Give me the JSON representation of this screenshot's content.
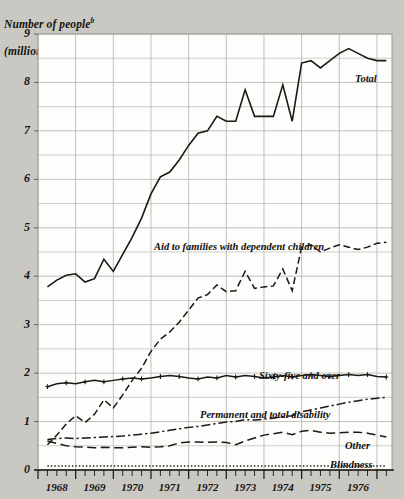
{
  "chart_data": {
    "type": "line",
    "title_superscript": "b",
    "xlabel": "",
    "ylabel": "Number of people (millions)",
    "ylim": [
      0,
      9
    ],
    "xlim": [
      1967.5,
      1976.9
    ],
    "y_major_ticks": [
      0,
      1,
      2,
      3,
      4,
      5,
      6,
      7,
      8,
      9
    ],
    "y_minor_step": 0.5,
    "x_tick_labels": [
      "1968",
      "1969",
      "1970",
      "1971",
      "1972",
      "1973",
      "1974",
      "1975",
      "1976"
    ],
    "x_tick_frequency": "quarterly minor ticks, annual major ticks",
    "grid": true,
    "legend_position": "inline labels at right of each curve",
    "line_color": "#1c1814",
    "grid_color": "#b9b9b6",
    "background_color": "#c9c8c3",
    "plot_background_color": "#fdfdfc",
    "series": [
      {
        "name": "Total",
        "label": "Total",
        "style": "solid",
        "markers": "none",
        "x": [
          1967.75,
          1968.0,
          1968.25,
          1968.5,
          1968.75,
          1969.0,
          1969.25,
          1969.5,
          1969.75,
          1970.0,
          1970.25,
          1970.5,
          1970.75,
          1971.0,
          1971.25,
          1971.5,
          1971.75,
          1972.0,
          1972.25,
          1972.5,
          1972.75,
          1973.0,
          1973.25,
          1973.5,
          1973.75,
          1974.0,
          1974.25,
          1974.5,
          1974.75,
          1975.0,
          1975.25,
          1975.5,
          1975.75,
          1976.0,
          1976.25,
          1976.5,
          1976.75
        ],
        "values": [
          3.78,
          3.92,
          4.02,
          4.05,
          3.88,
          3.95,
          4.35,
          4.1,
          4.45,
          4.8,
          5.2,
          5.7,
          6.05,
          6.15,
          6.4,
          6.7,
          6.95,
          7.0,
          7.3,
          7.2,
          7.2,
          7.85,
          7.3,
          7.3,
          7.3,
          7.95,
          7.2,
          8.4,
          8.45,
          8.3,
          8.45,
          8.6,
          8.7,
          8.6,
          8.5,
          8.45,
          8.45
        ]
      },
      {
        "name": "Aid to families with dependent children",
        "label": "Aid to families with dependent children",
        "style": "dashed",
        "markers": "none",
        "x": [
          1967.75,
          1968.0,
          1968.25,
          1968.5,
          1968.75,
          1969.0,
          1969.25,
          1969.5,
          1969.75,
          1970.0,
          1970.25,
          1970.5,
          1970.75,
          1971.0,
          1971.25,
          1971.5,
          1971.75,
          1972.0,
          1972.25,
          1972.5,
          1972.75,
          1973.0,
          1973.25,
          1973.5,
          1973.75,
          1974.0,
          1974.25,
          1974.5,
          1974.75,
          1975.0,
          1975.25,
          1975.5,
          1975.75,
          1976.0,
          1976.25,
          1976.5,
          1976.75
        ],
        "values": [
          0.52,
          0.72,
          0.95,
          1.12,
          0.98,
          1.15,
          1.45,
          1.28,
          1.55,
          1.85,
          2.1,
          2.45,
          2.7,
          2.85,
          3.05,
          3.3,
          3.55,
          3.62,
          3.82,
          3.68,
          3.7,
          4.1,
          3.75,
          3.78,
          3.8,
          4.15,
          3.7,
          4.6,
          4.65,
          4.5,
          4.58,
          4.65,
          4.6,
          4.55,
          4.6,
          4.68,
          4.7
        ]
      },
      {
        "name": "Sixty-five and over",
        "label": "Sixty-five and over",
        "style": "solid",
        "markers": "plus",
        "x": [
          1967.75,
          1968.0,
          1968.25,
          1968.5,
          1968.75,
          1969.0,
          1969.25,
          1969.5,
          1969.75,
          1970.0,
          1970.25,
          1970.5,
          1970.75,
          1971.0,
          1971.25,
          1971.5,
          1971.75,
          1972.0,
          1972.25,
          1972.5,
          1972.75,
          1973.0,
          1973.25,
          1973.5,
          1973.75,
          1974.0,
          1974.25,
          1974.5,
          1974.75,
          1975.0,
          1975.25,
          1975.5,
          1975.75,
          1976.0,
          1976.25,
          1976.5,
          1976.75
        ],
        "values": [
          1.72,
          1.78,
          1.8,
          1.78,
          1.82,
          1.85,
          1.82,
          1.85,
          1.88,
          1.9,
          1.88,
          1.9,
          1.93,
          1.95,
          1.93,
          1.9,
          1.88,
          1.92,
          1.9,
          1.95,
          1.92,
          1.95,
          1.93,
          1.9,
          1.92,
          1.95,
          1.92,
          1.95,
          1.97,
          1.95,
          1.93,
          1.95,
          1.97,
          1.95,
          1.97,
          1.93,
          1.92
        ]
      },
      {
        "name": "Permanent and total disability",
        "label": "Permanent and total disability",
        "style": "dash-dot",
        "markers": "none",
        "x": [
          1967.75,
          1968.0,
          1968.25,
          1968.5,
          1968.75,
          1969.0,
          1969.25,
          1969.5,
          1969.75,
          1970.0,
          1970.25,
          1970.5,
          1970.75,
          1971.0,
          1971.25,
          1971.5,
          1971.75,
          1972.0,
          1972.25,
          1972.5,
          1972.75,
          1973.0,
          1973.25,
          1973.5,
          1973.75,
          1974.0,
          1974.25,
          1974.5,
          1974.75,
          1975.0,
          1975.25,
          1975.5,
          1975.75,
          1976.0,
          1976.25,
          1976.5,
          1976.75
        ],
        "values": [
          0.63,
          0.65,
          0.66,
          0.65,
          0.66,
          0.67,
          0.68,
          0.69,
          0.7,
          0.72,
          0.74,
          0.76,
          0.79,
          0.82,
          0.85,
          0.88,
          0.9,
          0.93,
          0.96,
          0.99,
          1.0,
          1.04,
          1.03,
          1.05,
          1.07,
          1.1,
          1.12,
          1.2,
          1.24,
          1.28,
          1.32,
          1.36,
          1.4,
          1.43,
          1.46,
          1.48,
          1.5
        ]
      },
      {
        "name": "Other",
        "label": "Other",
        "style": "long-dash",
        "markers": "none",
        "x": [
          1967.75,
          1968.0,
          1968.25,
          1968.5,
          1968.75,
          1969.0,
          1969.25,
          1969.5,
          1969.75,
          1970.0,
          1970.25,
          1970.5,
          1970.75,
          1971.0,
          1971.25,
          1971.5,
          1971.75,
          1972.0,
          1972.25,
          1972.5,
          1972.75,
          1973.0,
          1973.25,
          1973.5,
          1973.75,
          1974.0,
          1974.25,
          1974.5,
          1974.75,
          1975.0,
          1975.25,
          1975.5,
          1975.75,
          1976.0,
          1976.25,
          1976.5,
          1976.75
        ],
        "values": [
          0.6,
          0.55,
          0.5,
          0.48,
          0.47,
          0.46,
          0.47,
          0.46,
          0.46,
          0.47,
          0.48,
          0.47,
          0.48,
          0.5,
          0.56,
          0.58,
          0.58,
          0.57,
          0.58,
          0.57,
          0.52,
          0.6,
          0.66,
          0.72,
          0.75,
          0.78,
          0.73,
          0.8,
          0.82,
          0.78,
          0.76,
          0.77,
          0.78,
          0.78,
          0.76,
          0.72,
          0.68
        ]
      },
      {
        "name": "Blindness",
        "label": "Blindness",
        "style": "dotted",
        "markers": "none",
        "x": [
          1967.75,
          1968.0,
          1968.25,
          1968.5,
          1968.75,
          1969.0,
          1969.25,
          1969.5,
          1969.75,
          1970.0,
          1970.25,
          1970.5,
          1970.75,
          1971.0,
          1971.25,
          1971.5,
          1971.75,
          1972.0,
          1972.25,
          1972.5,
          1972.75,
          1973.0,
          1973.25,
          1973.5,
          1973.75,
          1974.0,
          1974.25,
          1974.5,
          1974.75,
          1975.0,
          1975.25,
          1975.5,
          1975.75,
          1976.0,
          1976.25,
          1976.5,
          1976.75
        ],
        "values": [
          0.08,
          0.08,
          0.08,
          0.08,
          0.08,
          0.08,
          0.08,
          0.08,
          0.08,
          0.08,
          0.08,
          0.08,
          0.08,
          0.08,
          0.08,
          0.08,
          0.08,
          0.08,
          0.08,
          0.08,
          0.08,
          0.08,
          0.08,
          0.08,
          0.08,
          0.08,
          0.08,
          0.08,
          0.08,
          0.08,
          0.08,
          0.08,
          0.08,
          0.08,
          0.08,
          0.08,
          0.08
        ]
      }
    ],
    "series_label_positions": [
      {
        "name": "Total",
        "x": 355,
        "y": 73
      },
      {
        "name": "Aid to families with dependent children",
        "x": 154,
        "y": 241
      },
      {
        "name": "Sixty-five and over",
        "x": 259,
        "y": 370
      },
      {
        "name": "Permanent and total disability",
        "x": 200,
        "y": 409
      },
      {
        "name": "Other",
        "x": 345,
        "y": 440
      },
      {
        "name": "Blindness",
        "x": 330,
        "y": 459
      }
    ]
  }
}
